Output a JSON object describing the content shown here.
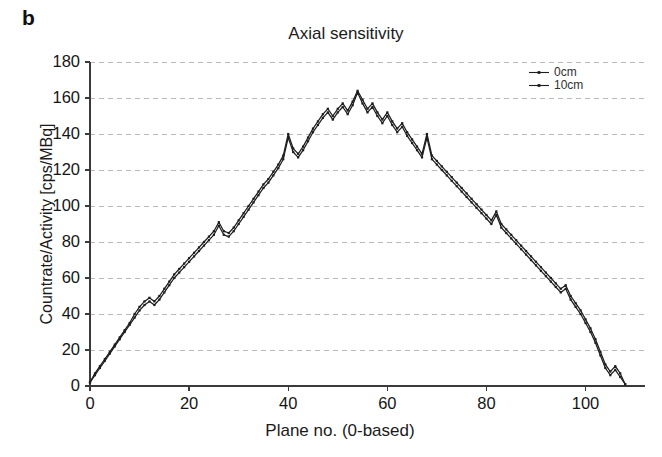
{
  "figure": {
    "panel_label": "b",
    "background_color": "#ffffff",
    "line_color": "#1d1d1d",
    "grid_color": "#b9b9c4",
    "axis_color": "#3a3a3a"
  },
  "legend": {
    "position": "top-right",
    "entries": [
      {
        "label": "0cm",
        "marker": "line-with-dot"
      },
      {
        "label": "10cm",
        "marker": "line-with-dot"
      }
    ]
  },
  "chart_data": {
    "type": "line",
    "title": "Axial sensitivity",
    "xlabel": "Plane no. (0-based)",
    "ylabel": "Countrate/Activity [cps/MBq]",
    "xlim": [
      0,
      112
    ],
    "ylim": [
      0,
      180
    ],
    "xticks": [
      0,
      20,
      40,
      60,
      80,
      100
    ],
    "yticks": [
      0,
      20,
      40,
      60,
      80,
      100,
      120,
      140,
      160,
      180
    ],
    "grid": true,
    "grid_axis": "y",
    "legend_position": "upper right",
    "x": [
      0,
      1,
      2,
      3,
      4,
      5,
      6,
      7,
      8,
      9,
      10,
      11,
      12,
      13,
      14,
      15,
      16,
      17,
      18,
      19,
      20,
      21,
      22,
      23,
      24,
      25,
      26,
      27,
      28,
      29,
      30,
      31,
      32,
      33,
      34,
      35,
      36,
      37,
      38,
      39,
      40,
      41,
      42,
      43,
      44,
      45,
      46,
      47,
      48,
      49,
      50,
      51,
      52,
      53,
      54,
      55,
      56,
      57,
      58,
      59,
      60,
      61,
      62,
      63,
      64,
      65,
      66,
      67,
      68,
      69,
      70,
      71,
      72,
      73,
      74,
      75,
      76,
      77,
      78,
      79,
      80,
      81,
      82,
      83,
      84,
      85,
      86,
      87,
      88,
      89,
      90,
      91,
      92,
      93,
      94,
      95,
      96,
      97,
      98,
      99,
      100,
      101,
      102,
      103,
      104,
      105,
      106,
      107,
      108
    ],
    "series": [
      {
        "name": "0cm",
        "values": [
          2,
          6,
          10,
          14,
          18,
          22,
          26,
          30,
          34,
          38,
          42,
          45,
          47,
          45,
          48,
          52,
          56,
          60,
          63,
          66,
          69,
          72,
          75,
          78,
          81,
          84,
          89,
          84,
          83,
          86,
          90,
          94,
          98,
          102,
          106,
          110,
          113,
          117,
          121,
          126,
          138,
          130,
          127,
          131,
          136,
          141,
          145,
          149,
          152,
          148,
          152,
          155,
          151,
          156,
          163,
          157,
          152,
          155,
          150,
          146,
          150,
          145,
          141,
          144,
          139,
          135,
          131,
          127,
          138,
          126,
          123,
          120,
          117,
          114,
          111,
          108,
          105,
          102,
          99,
          96,
          93,
          90,
          95,
          88,
          85,
          82,
          79,
          76,
          73,
          70,
          67,
          64,
          61,
          58,
          55,
          52,
          54,
          48,
          44,
          40,
          35,
          30,
          24,
          17,
          10,
          6,
          9,
          5,
          1
        ]
      },
      {
        "name": "10cm",
        "values": [
          2,
          7,
          11,
          15,
          19,
          23,
          27,
          31,
          35,
          40,
          44,
          47,
          49,
          47,
          50,
          54,
          58,
          62,
          65,
          68,
          71,
          74,
          77,
          80,
          83,
          86,
          91,
          86,
          85,
          88,
          92,
          96,
          100,
          104,
          108,
          112,
          115,
          119,
          123,
          128,
          140,
          132,
          129,
          133,
          138,
          143,
          147,
          151,
          154,
          150,
          154,
          157,
          153,
          158,
          164,
          159,
          154,
          157,
          152,
          148,
          152,
          147,
          143,
          146,
          141,
          137,
          133,
          129,
          140,
          128,
          125,
          122,
          119,
          116,
          113,
          110,
          107,
          104,
          101,
          98,
          95,
          92,
          97,
          90,
          87,
          84,
          81,
          78,
          75,
          72,
          69,
          66,
          63,
          60,
          57,
          54,
          56,
          50,
          46,
          42,
          37,
          32,
          26,
          19,
          12,
          8,
          11,
          7,
          1
        ]
      }
    ]
  }
}
